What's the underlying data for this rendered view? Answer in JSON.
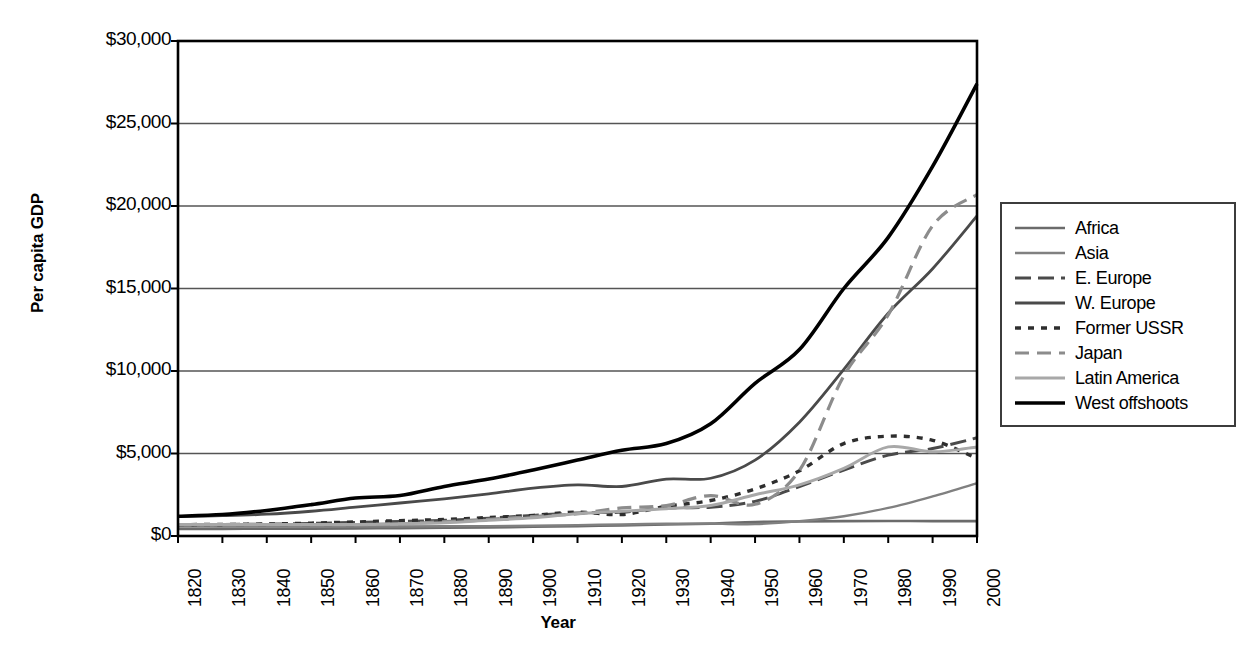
{
  "chart_data": {
    "type": "line",
    "title": "",
    "xlabel": "Year",
    "ylabel": "Per capita GDP",
    "xlim": [
      1820,
      2000
    ],
    "ylim": [
      0,
      30000
    ],
    "grid": true,
    "legend_position": "right",
    "y_ticks": [
      0,
      5000,
      10000,
      15000,
      20000,
      25000,
      30000
    ],
    "y_tick_labels": [
      "$0",
      "$5,000",
      "$10,000",
      "$15,000",
      "$20,000",
      "$25,000",
      "$30,000"
    ],
    "x_ticks": [
      1820,
      1830,
      1840,
      1850,
      1860,
      1870,
      1880,
      1890,
      1900,
      1910,
      1920,
      1930,
      1940,
      1950,
      1960,
      1970,
      1980,
      1990,
      2000
    ],
    "x_tick_labels": [
      "1820",
      "1830",
      "1840",
      "1850",
      "1860",
      "1870",
      "1880",
      "1890",
      "1900",
      "1910",
      "1920",
      "1930",
      "1940",
      "1950",
      "1960",
      "1970",
      "1980",
      "1990",
      "2000"
    ],
    "x": [
      1820,
      1830,
      1840,
      1850,
      1860,
      1870,
      1880,
      1890,
      1900,
      1910,
      1920,
      1930,
      1940,
      1950,
      1960,
      1970,
      1980,
      1990,
      2000
    ],
    "series": [
      {
        "name": "Africa",
        "color": "#6b6b6b",
        "width": 2.6,
        "dash": "none",
        "values": [
          420,
          430,
          440,
          450,
          460,
          480,
          500,
          520,
          560,
          600,
          640,
          700,
          750,
          850,
          880,
          900,
          910,
          900,
          900
        ]
      },
      {
        "name": "Asia",
        "color": "#808080",
        "width": 2.4,
        "dash": "none",
        "values": [
          580,
          580,
          580,
          580,
          580,
          580,
          590,
          600,
          620,
          660,
          700,
          740,
          750,
          720,
          900,
          1200,
          1700,
          2400,
          3200
        ]
      },
      {
        "name": "E. Europe",
        "color": "#4a4a4a",
        "width": 3.0,
        "dash": "16,7",
        "values": [
          680,
          700,
          720,
          760,
          820,
          880,
          950,
          1080,
          1250,
          1400,
          1450,
          1700,
          1750,
          2100,
          3000,
          4000,
          4900,
          5300,
          5950
        ]
      },
      {
        "name": "W. Europe",
        "color": "#4a4a4a",
        "width": 2.8,
        "dash": "none",
        "values": [
          1180,
          1230,
          1320,
          1500,
          1750,
          2000,
          2250,
          2550,
          2900,
          3100,
          3000,
          3450,
          3500,
          4600,
          6900,
          10100,
          13500,
          16200,
          19400
        ]
      },
      {
        "name": "Former USSR",
        "color": "#2e2e2e",
        "width": 3.4,
        "dash": "6,7",
        "values": [
          690,
          700,
          730,
          780,
          850,
          930,
          1000,
          1120,
          1250,
          1450,
          1300,
          1800,
          2150,
          2850,
          3950,
          5600,
          6050,
          5800,
          4700
        ]
      },
      {
        "name": "Japan",
        "color": "#8c8c8c",
        "width": 3.2,
        "dash": "14,8",
        "values": [
          670,
          670,
          670,
          670,
          680,
          740,
          870,
          1010,
          1180,
          1350,
          1700,
          1850,
          2450,
          1920,
          3980,
          9700,
          13400,
          18800,
          20700
        ]
      },
      {
        "name": "Latin America",
        "color": "#a8a8a8",
        "width": 3.0,
        "dash": "none",
        "values": [
          690,
          690,
          690,
          690,
          700,
          740,
          800,
          950,
          1100,
          1350,
          1500,
          1650,
          1850,
          2500,
          3100,
          4100,
          5400,
          5100,
          5400
        ]
      },
      {
        "name": "West offshoots",
        "color": "#000000",
        "width": 3.6,
        "dash": "none",
        "values": [
          1200,
          1300,
          1550,
          1900,
          2300,
          2450,
          3000,
          3450,
          4000,
          4600,
          5200,
          5600,
          6800,
          9250,
          11300,
          15000,
          18100,
          22400,
          27400
        ]
      }
    ]
  }
}
